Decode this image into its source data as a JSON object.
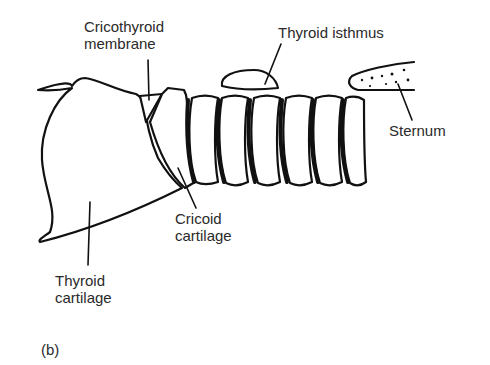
{
  "figure": {
    "panel_label": "(b)",
    "labels": {
      "cricothyroid_membrane": [
        "Cricothyroid",
        "membrane"
      ],
      "thyroid_isthmus": [
        "Thyroid isthmus"
      ],
      "sternum": [
        "Sternum"
      ],
      "cricoid_cartilage": [
        "Cricoid",
        "cartilage"
      ],
      "thyroid_cartilage": [
        "Thyroid",
        "cartilage"
      ]
    },
    "colors": {
      "ink": "#111111",
      "text": "#2a2a2a",
      "background": "#ffffff"
    }
  }
}
